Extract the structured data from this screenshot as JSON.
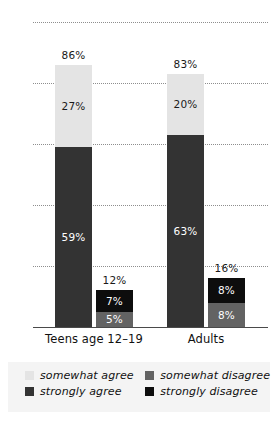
{
  "chart_data": {
    "type": "bar",
    "title": "",
    "subtitle": "",
    "xlabel": "",
    "ylabel": "",
    "ylim": [
      0,
      100
    ],
    "yticks": [
      "0",
      "20",
      "40",
      "60",
      "80",
      "100"
    ],
    "grid": true,
    "stacked": true,
    "legend_position": "bottom",
    "categories": [
      "Teens age 12–19",
      "Adults"
    ],
    "series": [
      {
        "name": "somewhat agree",
        "color": "#e4e4e4",
        "values": [
          27,
          20
        ]
      },
      {
        "name": "strongly agree",
        "color": "#333333",
        "values": [
          59,
          63
        ]
      },
      {
        "name": "somewhat disagree",
        "color": "#636363",
        "values": [
          5,
          8
        ]
      },
      {
        "name": "strongly disagree",
        "color": "#0d0d0d",
        "values": [
          7,
          8
        ]
      }
    ],
    "bars": [
      {
        "group": "Teens age 12–19",
        "stack": "agree",
        "total": 86,
        "total_label": "86%",
        "segments": [
          {
            "series": "strongly agree",
            "value": 59,
            "label": "59%",
            "color": "#333333",
            "text_color": "#ffffff"
          },
          {
            "series": "somewhat agree",
            "value": 27,
            "label": "27%",
            "color": "#e4e4e4",
            "text_color": "#1a1a1a"
          }
        ]
      },
      {
        "group": "Teens age 12–19",
        "stack": "disagree",
        "total": 12,
        "total_label": "12%",
        "segments": [
          {
            "series": "somewhat disagree",
            "value": 5,
            "label": "5%",
            "color": "#636363",
            "text_color": "#ffffff"
          },
          {
            "series": "strongly disagree",
            "value": 7,
            "label": "7%",
            "color": "#0d0d0d",
            "text_color": "#ffffff"
          }
        ]
      },
      {
        "group": "Adults",
        "stack": "agree",
        "total": 83,
        "total_label": "83%",
        "segments": [
          {
            "series": "strongly agree",
            "value": 63,
            "label": "63%",
            "color": "#333333",
            "text_color": "#ffffff"
          },
          {
            "series": "somewhat agree",
            "value": 20,
            "label": "20%",
            "color": "#e4e4e4",
            "text_color": "#1a1a1a"
          }
        ]
      },
      {
        "group": "Adults",
        "stack": "disagree",
        "total": 16,
        "total_label": "16%",
        "segments": [
          {
            "series": "somewhat disagree",
            "value": 8,
            "label": "8%",
            "color": "#636363",
            "text_color": "#ffffff"
          },
          {
            "series": "strongly disagree",
            "value": 8,
            "label": "8%",
            "color": "#0d0d0d",
            "text_color": "#ffffff"
          }
        ]
      }
    ],
    "legend": [
      {
        "label": "somewhat agree",
        "color": "#e4e4e4"
      },
      {
        "label": "somewhat disagree",
        "color": "#636363"
      },
      {
        "label": "strongly agree",
        "color": "#333333"
      },
      {
        "label": "strongly disagree",
        "color": "#0d0d0d"
      }
    ]
  },
  "axis": {
    "y_ticks": [
      {
        "label": "100",
        "value": 100
      },
      {
        "label": "80",
        "value": 80
      },
      {
        "label": "60",
        "value": 60
      },
      {
        "label": "40",
        "value": 40
      },
      {
        "label": "20",
        "value": 20
      },
      {
        "label": "0",
        "value": 0
      }
    ],
    "x_categories": [
      {
        "label": "Teens age 12–19"
      },
      {
        "label": "Adults"
      }
    ]
  },
  "colors": {
    "background": "#ffffff",
    "legend_background": "#f4f4f4",
    "gridline": "#8e8e8e",
    "axis": "#4a4a4a",
    "text": "#111111"
  }
}
